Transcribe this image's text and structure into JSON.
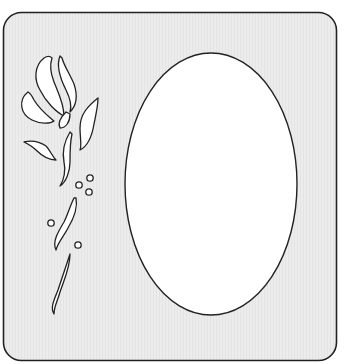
{
  "illustration": {
    "subject": "rose stencil frame with oval window",
    "colors": {
      "frame_fill": "#ebebeb",
      "outline": "#222222",
      "cutout_fill": "#ffffff",
      "background": "#ffffff"
    }
  }
}
